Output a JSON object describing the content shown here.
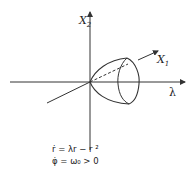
{
  "diagram": {
    "axes": {
      "vertical_label": "X",
      "vertical_sub": "2",
      "oblique_label": "X",
      "oblique_sub": "1",
      "horizontal_label": "λ"
    },
    "equations": [
      "ṙ = λr − r ²",
      "φ̇ = ω₀ > 0"
    ],
    "colors": {
      "stroke": "#333333",
      "background": "#ffffff"
    }
  }
}
